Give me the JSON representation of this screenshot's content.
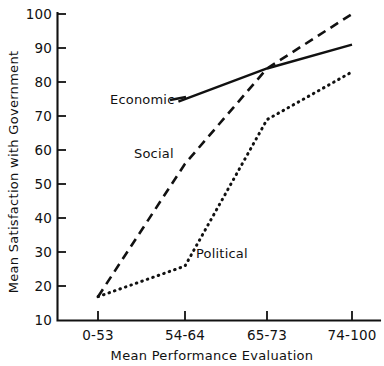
{
  "chart_data": {
    "type": "line",
    "title": "",
    "subtitle": "",
    "xlabel": "Mean Performance Evaluation",
    "ylabel": "Mean Satisfaction with Government",
    "categories": [
      "0-53",
      "54-64",
      "65-73",
      "74-100"
    ],
    "ylim": [
      10,
      100
    ],
    "yticks": [
      10,
      20,
      30,
      40,
      50,
      60,
      70,
      80,
      90,
      100
    ],
    "ytick_labels": [
      "10",
      "20",
      "30",
      "40",
      "50",
      "60",
      "70",
      "80",
      "90",
      "100"
    ],
    "grid": false,
    "legend_position": "inline-annotations",
    "series": [
      {
        "name": "Economic",
        "style": "solid",
        "color": "#111111",
        "x": [
          "54-64",
          "65-73",
          "74-100"
        ],
        "values": [
          75,
          84,
          91
        ],
        "label": "Economic"
      },
      {
        "name": "Social",
        "style": "dashed",
        "color": "#111111",
        "x": [
          "0-53",
          "54-64",
          "65-73",
          "74-100"
        ],
        "values": [
          17,
          56,
          84,
          100
        ],
        "label": "Social"
      },
      {
        "name": "Political",
        "style": "dotted",
        "color": "#111111",
        "x": [
          "0-53",
          "54-64",
          "65-73",
          "74-100"
        ],
        "values": [
          17,
          26,
          69,
          83
        ],
        "label": "Political"
      }
    ],
    "annotations": [
      {
        "text": "Economic",
        "series": "Economic"
      },
      {
        "text": "Social",
        "series": "Social"
      },
      {
        "text": "Political",
        "series": "Political"
      }
    ]
  }
}
